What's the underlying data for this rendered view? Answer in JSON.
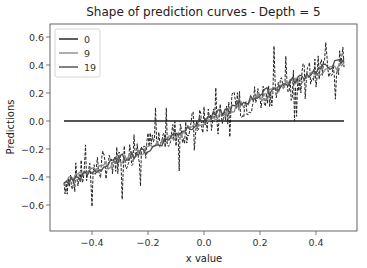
{
  "chart_data": {
    "type": "line",
    "title": "Shape of prediction curves - Depth = 5",
    "xlabel": "x value",
    "ylabel": "Predictions",
    "xlim": [
      -0.52,
      0.53
    ],
    "ylim": [
      -0.76,
      0.66
    ],
    "xticks": [
      -0.4,
      -0.2,
      0.0,
      0.2,
      0.4
    ],
    "xtick_labels": [
      "−0.4",
      "−0.2",
      "0.0",
      "0.2",
      "0.4"
    ],
    "yticks": [
      -0.6,
      -0.4,
      -0.2,
      0.0,
      0.2,
      0.4,
      0.6
    ],
    "ytick_labels": [
      "−0.6",
      "−0.4",
      "−0.2",
      "0.0",
      "0.2",
      "0.4",
      "0.6"
    ],
    "grid": false,
    "legend_position": "upper left",
    "legend": [
      "0",
      "9",
      "19"
    ],
    "series": [
      {
        "name": "0",
        "color": "#1a1a1a",
        "style": "solid",
        "x": [
          -0.5,
          0.5
        ],
        "y": [
          0.0,
          0.0
        ]
      },
      {
        "name": "9",
        "color": "#8c8c8c",
        "style": "solid",
        "x": [
          -0.5,
          -0.4,
          -0.3,
          -0.2,
          -0.1,
          0.0,
          0.1,
          0.2,
          0.3,
          0.4,
          0.5
        ],
        "y": [
          -0.42,
          -0.36,
          -0.28,
          -0.2,
          -0.1,
          0.0,
          0.08,
          0.18,
          0.26,
          0.34,
          0.4
        ]
      },
      {
        "name": "19",
        "color": "#4d4d4d",
        "style": "solid",
        "x": [
          -0.5,
          -0.4,
          -0.3,
          -0.2,
          -0.1,
          0.0,
          0.1,
          0.2,
          0.3,
          0.4,
          0.5
        ],
        "y": [
          -0.44,
          -0.37,
          -0.27,
          -0.21,
          -0.09,
          0.01,
          0.09,
          0.19,
          0.27,
          0.36,
          0.43
        ]
      },
      {
        "name": "data",
        "color": "#222222",
        "style": "dashed",
        "in_legend": false,
        "description": "noisy target values, roughly y = 0.9x with noise amplitude ~0.2",
        "x_range": [
          -0.5,
          0.5
        ],
        "y_range": [
          -0.72,
          0.62
        ]
      }
    ]
  }
}
